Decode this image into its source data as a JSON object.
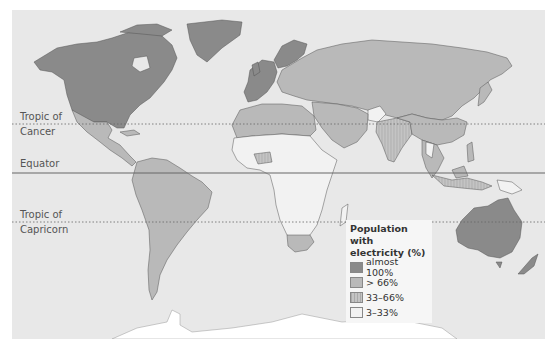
{
  "map": {
    "type": "choropleth-world",
    "title": "Population with electricity (%)",
    "colors": {
      "ocean": "#e8e8e8",
      "almost_100": "#8a8a8a",
      "gt_66": "#b9b9b9",
      "33_66": "#c4c4c4",
      "3_33": "#f2f2f2",
      "border": "#555555",
      "antarctica": "#ffffff"
    },
    "reference_lines": [
      {
        "name": "Tropic of Cancer",
        "label_line1": "Tropic of",
        "label_line2": "Cancer",
        "style": "dotted"
      },
      {
        "name": "Equator",
        "label_line1": "Equator",
        "label_line2": "",
        "style": "solid"
      },
      {
        "name": "Tropic of Capricorn",
        "label_line1": "Tropic of",
        "label_line2": "Capricorn",
        "style": "dotted"
      }
    ],
    "legend": {
      "title_line1": "Population with",
      "title_line2": "electricity (%)",
      "items": [
        {
          "label": "almost 100%",
          "color": "#8a8a8a"
        },
        {
          "label": "> 66%",
          "color": "#b9b9b9"
        },
        {
          "label": "33–66%",
          "color": "#c4c4c4"
        },
        {
          "label": "3–33%",
          "color": "#f2f2f2"
        }
      ]
    },
    "regions": {
      "almost_100": [
        "North America (USA, Canada)",
        "Greenland",
        "Western Europe",
        "Scandinavia",
        "Australia",
        "New Zealand"
      ],
      "gt_66": [
        "Russia",
        "China",
        "Eastern Europe",
        "Middle East",
        "North Africa",
        "Latin America",
        "South Africa",
        "Southeast Asia (parts)"
      ],
      "33_66": [
        "India",
        "Pakistan",
        "Indonesia (parts)",
        "West Africa (parts)"
      ],
      "3_33": [
        "Sub-Saharan Africa",
        "Afghanistan",
        "Myanmar",
        "Papua New Guinea",
        "Madagascar"
      ]
    }
  }
}
